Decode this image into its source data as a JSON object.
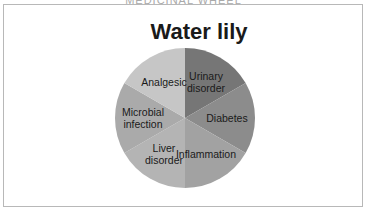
{
  "page": {
    "top_caption": "MEDICINAL WHEEL"
  },
  "chart_data": {
    "type": "pie",
    "title": "Water lily",
    "categories": [
      "Urinary disorder",
      "Diabetes",
      "Inflammation",
      "Liver disorder",
      "Microbial infection",
      "Analgesic"
    ],
    "values": [
      1,
      1,
      1,
      1,
      1,
      1
    ],
    "colors": [
      "#767676",
      "#8c8c8c",
      "#a2a2a2",
      "#b4b4b4",
      "#aaaaaa",
      "#c6c6c6"
    ],
    "start_angle_deg": 0,
    "direction": "clockwise",
    "legend": "none",
    "data_labels": "category name inside slice",
    "labels": [
      {
        "lines": [
          "Urinary",
          "disorder"
        ]
      },
      {
        "lines": [
          "Diabetes"
        ]
      },
      {
        "lines": [
          "Inflammation"
        ]
      },
      {
        "lines": [
          "Liver",
          "disorder"
        ]
      },
      {
        "lines": [
          "Microbial",
          "infection"
        ]
      },
      {
        "lines": [
          "Analgesic"
        ]
      }
    ]
  }
}
